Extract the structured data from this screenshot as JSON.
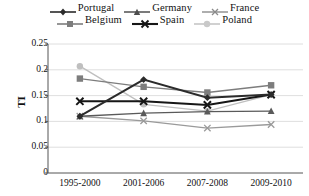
{
  "chart_data": {
    "type": "line",
    "title": "",
    "xlabel": "",
    "ylabel": "TI",
    "categories": [
      "1995-2000",
      "2001-2006",
      "2007-2008",
      "2009-2010"
    ],
    "ylim": [
      0,
      0.25
    ],
    "y_ticks": [
      "0",
      "0.05",
      "0.1",
      "0.15",
      "0.2",
      "0.25"
    ],
    "y_tick_values": [
      0,
      0.05,
      0.1,
      0.15,
      0.2,
      0.25
    ],
    "grid": "horizontal",
    "legend_position": "top",
    "series": [
      {
        "name": "Portugal",
        "marker": "diamond",
        "color": "#2b2b2b",
        "values": [
          0.11,
          0.181,
          0.146,
          0.152
        ]
      },
      {
        "name": "Germany",
        "marker": "triangle",
        "color": "#5a5a5a",
        "values": [
          0.11,
          0.116,
          0.119,
          0.12
        ]
      },
      {
        "name": "France",
        "marker": "x-thin",
        "color": "#9a9a9a",
        "values": [
          0.11,
          0.101,
          0.087,
          0.094
        ]
      },
      {
        "name": "Belgium",
        "marker": "square",
        "color": "#7d7d7d",
        "values": [
          0.183,
          0.167,
          0.156,
          0.17
        ]
      },
      {
        "name": "Spain",
        "marker": "x-bold",
        "color": "#161616",
        "values": [
          0.139,
          0.139,
          0.132,
          0.152
        ]
      },
      {
        "name": "Poland",
        "marker": "circle",
        "color": "#bfbfbf",
        "values": [
          0.207,
          0.133,
          0.12,
          0.152
        ]
      }
    ]
  },
  "legend": {
    "rows": [
      [
        "Portugal",
        "Germany",
        "France"
      ],
      [
        "Belgium",
        "Spain",
        "Poland"
      ]
    ]
  }
}
